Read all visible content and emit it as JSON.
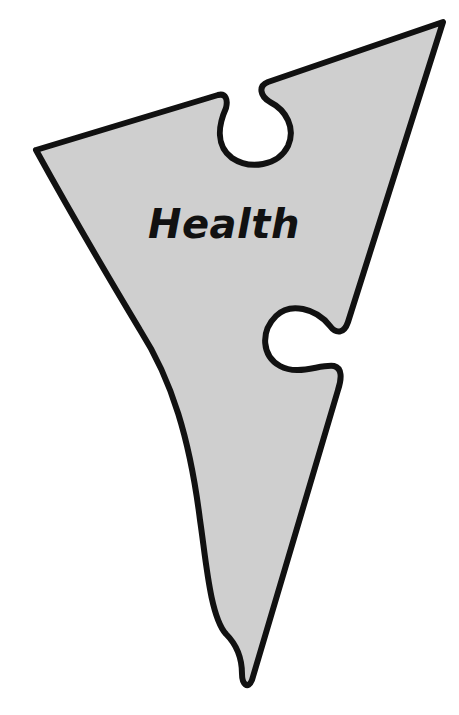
{
  "diagram": {
    "type": "puzzle-piece",
    "label": "Health",
    "colors": {
      "fill": "#cfcfcf",
      "stroke": "#111111",
      "background": "#ffffff",
      "text": "#111111"
    }
  }
}
